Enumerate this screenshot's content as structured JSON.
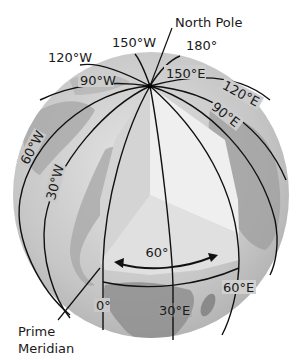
{
  "figure": {
    "title_callouts": {
      "north_pole": "North Pole",
      "prime_meridian_line1": "Prime",
      "prime_meridian_line2": "Meridian"
    },
    "meridian_labels": {
      "w150": "150°W",
      "w120": "120°W",
      "w90": "90°W",
      "w60": "60°W",
      "w30": "30°W",
      "zero": "0°",
      "e30": "30°E",
      "e60": "60°E",
      "e90": "90°E",
      "e120": "120°E",
      "e150": "150°E",
      "e180": "180°"
    },
    "angle_label": "60°",
    "colors": {
      "globe_base": "#c9c9c9",
      "land": "#9a9a9a",
      "wedge_left": "#d6d6d6",
      "wedge_right": "#efefef",
      "wedge_bottom": "#e3e3e3",
      "lines": "#111111"
    }
  }
}
